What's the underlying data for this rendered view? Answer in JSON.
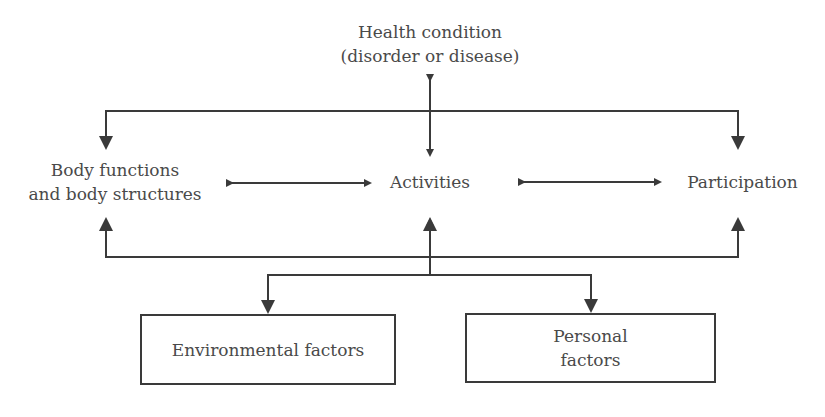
{
  "diagram": {
    "colors": {
      "line": "#3a3a3a",
      "text": "#4a4a4a",
      "background": "#ffffff"
    },
    "nodes": {
      "health_condition": {
        "line1": "Health condition",
        "line2": "(disorder or disease)"
      },
      "body": {
        "line1": "Body functions",
        "line2": "and body structures"
      },
      "activities": {
        "label": "Activities"
      },
      "participation": {
        "label": "Participation"
      },
      "environmental": {
        "label": "Environmental factors"
      },
      "personal": {
        "line1": "Personal",
        "line2": "factors"
      }
    },
    "edges": [
      {
        "from": "health_condition",
        "to": "activities",
        "type": "bidirectional"
      },
      {
        "from": "health_condition",
        "to": "body",
        "type": "directed"
      },
      {
        "from": "health_condition",
        "to": "participation",
        "type": "directed"
      },
      {
        "from": "body",
        "to": "activities",
        "type": "bidirectional"
      },
      {
        "from": "activities",
        "to": "participation",
        "type": "bidirectional"
      },
      {
        "from": "contextual_factors",
        "to": "activities",
        "type": "directed"
      },
      {
        "from": "contextual_factors",
        "to": "body",
        "type": "directed"
      },
      {
        "from": "contextual_factors",
        "to": "participation",
        "type": "directed"
      },
      {
        "from": "contextual_factors",
        "to": "environmental",
        "type": "directed"
      },
      {
        "from": "contextual_factors",
        "to": "personal",
        "type": "directed"
      }
    ]
  }
}
